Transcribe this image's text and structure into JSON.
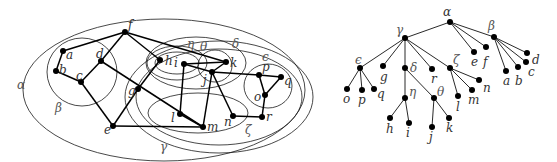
{
  "figure": {
    "left_panel": "nested region hypergraph",
    "right_panel": "region containment tree"
  },
  "graph": {
    "regions": [
      {
        "id": "alpha",
        "label": "α"
      },
      {
        "id": "beta",
        "label": "β"
      },
      {
        "id": "gamma",
        "label": "γ"
      },
      {
        "id": "delta",
        "label": "δ"
      },
      {
        "id": "epsilon",
        "label": "ϵ"
      },
      {
        "id": "zeta",
        "label": "ζ"
      },
      {
        "id": "eta",
        "label": "η"
      },
      {
        "id": "theta",
        "label": "θ"
      }
    ],
    "nodes": [
      {
        "id": "a",
        "label": "a"
      },
      {
        "id": "b",
        "label": "b"
      },
      {
        "id": "c",
        "label": "c"
      },
      {
        "id": "d",
        "label": "d"
      },
      {
        "id": "e",
        "label": "e"
      },
      {
        "id": "f",
        "label": "f"
      },
      {
        "id": "g",
        "label": "g"
      },
      {
        "id": "h",
        "label": "h"
      },
      {
        "id": "i",
        "label": "i"
      },
      {
        "id": "j",
        "label": "j"
      },
      {
        "id": "k",
        "label": "k"
      },
      {
        "id": "l",
        "label": "l"
      },
      {
        "id": "m",
        "label": "m"
      },
      {
        "id": "n",
        "label": "n"
      },
      {
        "id": "o",
        "label": "o"
      },
      {
        "id": "p",
        "label": "p"
      },
      {
        "id": "q",
        "label": "q"
      },
      {
        "id": "r",
        "label": "r"
      }
    ],
    "edges": [
      [
        "a",
        "b"
      ],
      [
        "a",
        "f"
      ],
      [
        "b",
        "c"
      ],
      [
        "c",
        "d"
      ],
      [
        "c",
        "e"
      ],
      [
        "d",
        "f"
      ],
      [
        "d",
        "m"
      ],
      [
        "f",
        "h"
      ],
      [
        "f",
        "k"
      ],
      [
        "h",
        "g"
      ],
      [
        "g",
        "e"
      ],
      [
        "e",
        "m"
      ],
      [
        "i",
        "k"
      ],
      [
        "i",
        "j"
      ],
      [
        "i",
        "l"
      ],
      [
        "l",
        "m"
      ],
      [
        "j",
        "m"
      ],
      [
        "j",
        "n"
      ],
      [
        "j",
        "p"
      ],
      [
        "n",
        "r"
      ],
      [
        "r",
        "o"
      ],
      [
        "o",
        "p"
      ],
      [
        "p",
        "q"
      ],
      [
        "q",
        "o"
      ]
    ]
  },
  "tree": {
    "root": "α",
    "children": {
      "α": [
        "γ",
        "e",
        "f",
        "β"
      ],
      "β": [
        "a",
        "b",
        "c",
        "d"
      ],
      "γ": [
        "ϵ",
        "g",
        "δ",
        "r",
        "ζ"
      ],
      "ϵ": [
        "o",
        "p",
        "q"
      ],
      "δ": [
        "η",
        "θ"
      ],
      "η": [
        "h",
        "i"
      ],
      "θ": [
        "j",
        "k"
      ],
      "ζ": [
        "l",
        "m",
        "n"
      ]
    }
  }
}
